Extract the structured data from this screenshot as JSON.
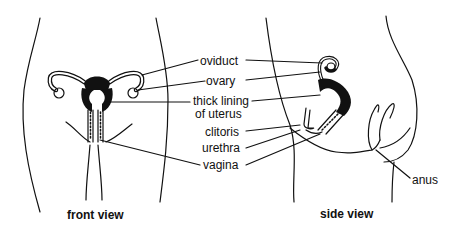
{
  "diagram": {
    "type": "anatomy-labeled",
    "views": [
      {
        "id": "front",
        "caption": "front view"
      },
      {
        "id": "side",
        "caption": "side view"
      }
    ],
    "labels": {
      "oviduct": "oviduct",
      "ovary": "ovary",
      "thick_lining_1": "thick lining",
      "thick_lining_2": "of uterus",
      "clitoris": "clitoris",
      "urethra": "urethra",
      "vagina": "vagina",
      "anus": "anus"
    },
    "colors": {
      "line": "#111111",
      "fill": "#111111",
      "background": "#ffffff"
    }
  }
}
